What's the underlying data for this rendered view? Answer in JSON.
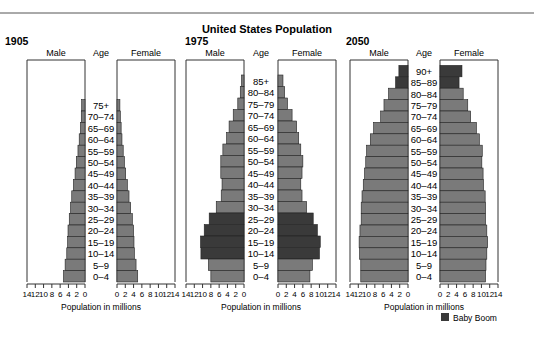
{
  "chart_data": {
    "type": "bar",
    "subtype": "population-pyramid",
    "title": "United States Population",
    "xlabel": "Population in millions",
    "xlim": [
      0,
      14
    ],
    "x_ticks": [
      0,
      2,
      4,
      6,
      8,
      10,
      12,
      14
    ],
    "headers": {
      "male": "Male",
      "age": "Age",
      "female": "Female"
    },
    "legend": {
      "label": "Baby Boom",
      "color": "#3a3a3a",
      "position": "bottom-right"
    },
    "colors": {
      "bar": "#7a7a7a",
      "highlight": "#3a3a3a",
      "frame": "#333333"
    },
    "panels": [
      {
        "year": "1905",
        "ages": [
          "75+",
          "70–74",
          "65–69",
          "60–64",
          "55–59",
          "50–54",
          "45–49",
          "40–44",
          "35–39",
          "30–34",
          "25–29",
          "20–24",
          "15–19",
          "10–14",
          "5–9",
          "0–4"
        ],
        "male": [
          0.8,
          0.9,
          1.1,
          1.4,
          1.7,
          2.1,
          2.4,
          2.8,
          3.2,
          3.5,
          3.8,
          4.1,
          4.2,
          4.4,
          4.8,
          5.2
        ],
        "female": [
          0.7,
          0.8,
          1.0,
          1.2,
          1.5,
          1.8,
          2.1,
          2.5,
          2.9,
          3.3,
          3.7,
          4.0,
          4.1,
          4.2,
          4.6,
          5.0
        ],
        "highlight": []
      },
      {
        "year": "1975",
        "ages": [
          "85+",
          "80–84",
          "75–79",
          "70–74",
          "65–69",
          "60–64",
          "55–59",
          "50–54",
          "45–49",
          "40–44",
          "35–39",
          "30–34",
          "25–29",
          "20–24",
          "15–19",
          "10–14",
          "5–9",
          "0–4"
        ],
        "male": [
          0.6,
          0.9,
          1.5,
          2.6,
          3.6,
          4.2,
          5.1,
          5.6,
          5.6,
          5.3,
          5.5,
          6.7,
          8.4,
          9.6,
          10.5,
          10.4,
          8.6,
          8.0
        ],
        "female": [
          1.2,
          1.6,
          2.3,
          3.4,
          4.5,
          5.0,
          5.5,
          6.0,
          5.8,
          5.5,
          5.8,
          6.9,
          8.5,
          9.5,
          10.2,
          10.0,
          8.3,
          7.7
        ],
        "highlight": [
          "25–29",
          "20–24",
          "15–19",
          "10–14"
        ]
      },
      {
        "year": "2050",
        "ages": [
          "90+",
          "85–89",
          "80–84",
          "75–79",
          "70–74",
          "65–69",
          "60–64",
          "55–59",
          "50–54",
          "45–49",
          "40–44",
          "35–39",
          "30–34",
          "25–29",
          "20–24",
          "15–19",
          "10–14",
          "5–9",
          "0–4"
        ],
        "male": [
          2.2,
          3.0,
          4.7,
          5.8,
          6.6,
          8.3,
          9.1,
          10.0,
          10.2,
          10.5,
          10.8,
          11.1,
          11.3,
          11.3,
          11.6,
          11.8,
          11.7,
          11.4,
          11.4
        ],
        "female": [
          5.3,
          4.6,
          5.6,
          6.7,
          7.4,
          8.8,
          9.5,
          10.2,
          10.1,
          10.4,
          10.5,
          10.9,
          11.0,
          11.0,
          11.3,
          11.5,
          11.3,
          11.1,
          11.0
        ],
        "highlight": [
          "90+",
          "85–89"
        ]
      }
    ]
  }
}
